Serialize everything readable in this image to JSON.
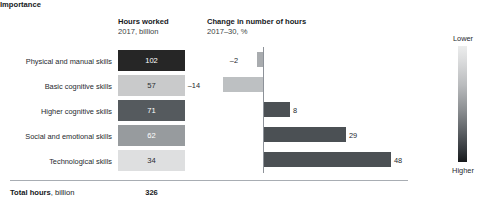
{
  "headers": {
    "hours": {
      "line1": "Hours worked",
      "line2": "2017, billion"
    },
    "change": {
      "line1": "Change in number of hours",
      "line2": "2017–30, %"
    },
    "importance": "Importance"
  },
  "legend": {
    "top_label": "Lower",
    "bottom_label": "Higher",
    "gradient_top": "#ECEDED",
    "gradient_bottom": "#17191B"
  },
  "total": {
    "label_bold": "Total hours",
    "label_rest": ", billion",
    "value": "326"
  },
  "chart_data": {
    "type": "bar",
    "title": "",
    "categories": [
      "Physical and manual skills",
      "Basic cognitive skills",
      "Higher cognitive skills",
      "Social and emotional skills",
      "Technological skills"
    ],
    "series": [
      {
        "name": "Hours worked 2017, billion",
        "values": [
          102,
          57,
          71,
          62,
          34
        ],
        "labels": [
          "102",
          "57",
          "71",
          "62",
          "34"
        ],
        "fills": [
          "#262626",
          "#C9CACB",
          "#555A5E",
          "#979B9E",
          "#DEDFE0"
        ],
        "text_colors": [
          "#FFFFFF",
          "#2A2E32",
          "#FFFFFF",
          "#FFFFFF",
          "#2A2E32"
        ]
      },
      {
        "name": "Change in number of hours 2017–30, %",
        "values": [
          -2,
          -14,
          8,
          29,
          48
        ],
        "labels": [
          "–2",
          "–14",
          "8",
          "29",
          "48"
        ],
        "fills": [
          "#A9ACAF",
          "#BDC0C2",
          "#4B5054",
          "#4B5054",
          "#4B5054"
        ]
      }
    ],
    "xlabel": "",
    "ylabel": "",
    "grid": false,
    "legend_position": "right",
    "total": 326
  },
  "rows": [
    {
      "top": 52,
      "bar_left": 257,
      "bar_width": 6,
      "label_left": 238,
      "label_align": "right"
    },
    {
      "top": 77,
      "bar_left": 223,
      "bar_width": 40,
      "label_left": 200,
      "label_align": "right"
    },
    {
      "top": 102,
      "bar_left": 264,
      "bar_width": 26,
      "label_left": 293,
      "label_align": "left"
    },
    {
      "top": 127,
      "bar_left": 264,
      "bar_width": 82,
      "label_left": 349,
      "label_align": "left"
    },
    {
      "top": 152,
      "bar_left": 264,
      "bar_width": 127,
      "label_left": 394,
      "label_align": "left"
    }
  ],
  "box_geometry": [
    {
      "top": 50,
      "height": 21
    },
    {
      "top": 75,
      "height": 21
    },
    {
      "top": 100,
      "height": 21
    },
    {
      "top": 125,
      "height": 21
    },
    {
      "top": 150,
      "height": 21
    }
  ],
  "label_tops": [
    57,
    82,
    107,
    132,
    157
  ]
}
